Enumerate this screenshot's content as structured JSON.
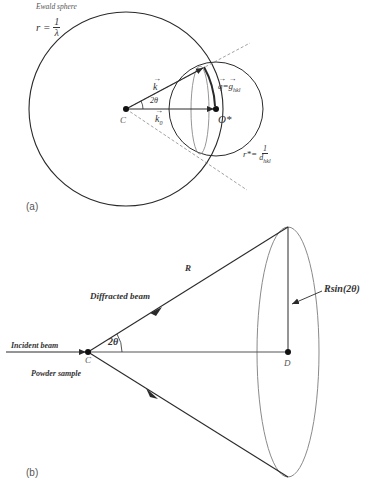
{
  "panel_a": {
    "tag": "(a)",
    "ewald_title": "Ewald sphere",
    "r_symbol": "r =",
    "r_num": "1",
    "r_den": "λ",
    "k_label": "k",
    "k0_label": "k",
    "k0_sub": "0",
    "angle_label": "2θ",
    "center_label": "C",
    "origin_label": "O*",
    "q_label": "q",
    "q_eq": "=",
    "g_label": "g",
    "g_sub": "hkl",
    "rstar_symbol": "r*=",
    "rstar_num": "1",
    "rstar_den": "d",
    "rstar_sub": "hkl"
  },
  "panel_b": {
    "tag": "(b)",
    "incident_beam": "Incident beam",
    "powder_sample": "Powder sample",
    "diffracted_beam": "Diffracted beam",
    "radius_label": "R",
    "angle_label": "2θ",
    "center_label": "C",
    "detector_point_label": "D",
    "cone_radius_label": "Rsin(2θ)"
  },
  "colors": {
    "line": "#2a2a2a",
    "grey_line": "#8a8a8a",
    "dashed": "#7a7a7a"
  }
}
